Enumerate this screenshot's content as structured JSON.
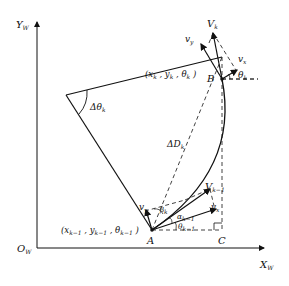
{
  "diagram": {
    "axes": {
      "y_label": "Y",
      "y_sub": "W",
      "x_label": "X",
      "x_sub": "W",
      "origin_label": "O",
      "origin_sub": "W"
    },
    "points": {
      "A": "A",
      "B": "B",
      "C": "C"
    },
    "coords": {
      "B_coord": "(x",
      "B_coord_full": "( x_k , y_k , θ_k )",
      "A_coord_full": "( x_{k-1} , y_{k-1} , θ_{k-1} )"
    },
    "labels": {
      "delta_theta": "Δθ",
      "delta_theta_sub": "k",
      "delta_D": "ΔD",
      "delta_D_sub": "k",
      "Vk": "V",
      "Vk_sub": "k",
      "Vk1": "V",
      "Vk1_sub": "k−1",
      "vy": "v",
      "vy_sub": "y",
      "vx": "v",
      "vx_sub": "x",
      "theta_k": "θ",
      "theta_k_sub": "k",
      "theta_k1": "θ",
      "theta_k1_sub": "k−1",
      "alpha_k1": "α",
      "alpha_k1_sub": "k−1",
      "beta_k": "β",
      "beta_k_sub": "k"
    },
    "colors": {
      "line": "#111111",
      "background": "#ffffff"
    }
  }
}
